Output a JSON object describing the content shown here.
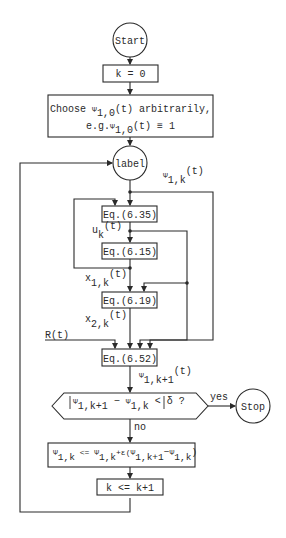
{
  "diagram": {
    "type": "flowchart",
    "nodes": {
      "start": {
        "shape": "circle",
        "label": "Start"
      },
      "init_k": {
        "shape": "box",
        "label": "k = 0"
      },
      "init_psi": {
        "shape": "box",
        "line1_prefix": "Choose ",
        "line1_psi": "Ψ",
        "line1_sub": "1,0",
        "line1_suffix": "(t) arbitrarily,",
        "line2_prefix": "e.g.",
        "line2_psi": "Ψ",
        "line2_sub": "1,0",
        "line2_suffix": "(t) ≡ 1"
      },
      "label": {
        "shape": "circle",
        "label": "label"
      },
      "eq635": {
        "shape": "box",
        "label": "Eq.(6.35)"
      },
      "eq615": {
        "shape": "box",
        "label": "Eq.(6.15)"
      },
      "eq619": {
        "shape": "box",
        "label": "Eq.(6.19)"
      },
      "eq652": {
        "shape": "box",
        "label": "Eq.(6.52)"
      },
      "decision": {
        "shape": "hexagon",
        "psi_a": "Ψ",
        "sub_a": "1,k+1",
        "minus": " − ",
        "psi_b": "Ψ",
        "sub_b": "1,k",
        "tail": " < δ ?"
      },
      "stop": {
        "shape": "circle",
        "label": "Stop"
      },
      "update": {
        "shape": "box",
        "psi1": "Ψ",
        "sub1": "1,k",
        "assign": " <= ",
        "psi2": "Ψ",
        "sub2": "1,k",
        "plus_eps": "+ε(",
        "psi3": "Ψ",
        "sub3": "1,k+1",
        "minus": "−",
        "psi4": "Ψ",
        "sub4": "1,k",
        "close": ")"
      },
      "increment": {
        "shape": "box",
        "label": "k <= k+1"
      }
    },
    "edge_labels": {
      "psi_1k": {
        "psi": "Ψ",
        "sub": "1,k",
        "sup": "(t)"
      },
      "u_k": {
        "base": "u",
        "sub": "k",
        "sup": "(t)"
      },
      "x_1k": {
        "base": "x",
        "sub": "1,k",
        "sup": "(t)"
      },
      "x_2k": {
        "base": "x",
        "sub": "2,k",
        "sup": "(t)"
      },
      "r_t": "R(t)",
      "psi_1k1": {
        "psi": "Ψ",
        "sub": "1,k+1",
        "sup": "(t)"
      },
      "yes": "yes",
      "no": "no"
    },
    "colors": {
      "stroke": "#2a2a2a",
      "background": "#ffffff"
    }
  }
}
